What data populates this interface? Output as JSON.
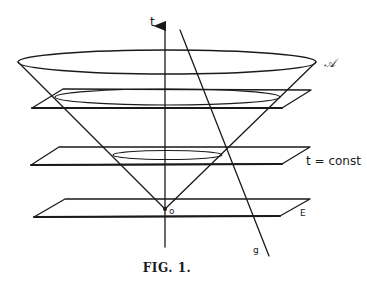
{
  "figure": {
    "caption": "FIG. 1.",
    "labels": {
      "time_axis": "t",
      "cone_surface": "𝒜",
      "plane_t_const": "t = const",
      "plane_E": "E",
      "origin": "o",
      "worldline": "g"
    },
    "elements": {
      "axis": "time axis t (vertical arrow)",
      "cone": "light cone with vertex at origin o",
      "planes": [
        "upper plane",
        "t = const plane",
        "E plane"
      ],
      "line": "straight line g crossing the cone"
    },
    "stroke_color": "#1a1a1a",
    "background": "#ffffff"
  }
}
